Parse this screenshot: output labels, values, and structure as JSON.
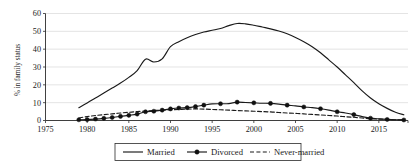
{
  "chart_data": {
    "type": "line",
    "title": "",
    "xlabel": "",
    "ylabel": "% in family status",
    "xlim": [
      1975,
      2018.5
    ],
    "ylim": [
      0,
      60
    ],
    "yticks": [
      0,
      10,
      20,
      30,
      40,
      50,
      60
    ],
    "xticks": [
      1975,
      1980,
      1985,
      1990,
      1995,
      2000,
      2005,
      2010,
      2015
    ],
    "ytick_labels": [
      "0",
      "10",
      "20",
      "30",
      "40",
      "50",
      "60"
    ],
    "xtick_labels": [
      "1975",
      "1980",
      "1985",
      "1990",
      "1995",
      "2000",
      "2005",
      "2010",
      "2015"
    ],
    "grid": "horizontal",
    "legend_position": "bottom",
    "x": [
      1979,
      1980,
      1981,
      1982,
      1983,
      1984,
      1985,
      1986,
      1987,
      1988,
      1989,
      1990,
      1991,
      1992,
      1993,
      1994,
      1995,
      1996,
      1997,
      1998,
      1999,
      2000,
      2001,
      2002,
      2003,
      2004,
      2005,
      2006,
      2007,
      2008,
      2009,
      2010,
      2011,
      2012,
      2013,
      2014,
      2015,
      2016,
      2017,
      2018
    ],
    "series": [
      {
        "name": "Married",
        "style": "solid",
        "markers": false,
        "values": [
          7.2,
          9.8,
          12.6,
          15.4,
          18.2,
          21.0,
          24.2,
          28.0,
          34.4,
          32.8,
          34.6,
          41.4,
          44.2,
          46.4,
          48.2,
          49.6,
          50.6,
          51.6,
          53.2,
          54.4,
          54.2,
          53.4,
          52.4,
          51.4,
          50.2,
          48.6,
          46.6,
          44.2,
          41.4,
          38.0,
          34.0,
          30.0,
          25.6,
          21.2,
          16.6,
          12.6,
          9.4,
          6.8,
          4.6,
          3.2
        ]
      },
      {
        "name": "Divorced",
        "style": "solid",
        "markers": true,
        "values": [
          0.4,
          0.5,
          0.8,
          1.2,
          1.7,
          2.3,
          2.9,
          3.6,
          4.9,
          5.2,
          5.8,
          6.5,
          7.0,
          7.2,
          7.8,
          8.6,
          9.3,
          9.4,
          9.5,
          10.3,
          10.1,
          9.9,
          9.7,
          9.6,
          9.2,
          8.6,
          8.2,
          7.6,
          7.2,
          6.6,
          5.8,
          4.9,
          4.2,
          3.3,
          2.2,
          1.3,
          0.9,
          0.6,
          0.4,
          0.3
        ]
      },
      {
        "name": "Never-married",
        "style": "dashed",
        "markers": false,
        "values": [
          1.4,
          2.2,
          2.8,
          3.3,
          3.7,
          4.2,
          4.6,
          5.0,
          5.3,
          5.6,
          5.8,
          6.0,
          6.2,
          6.4,
          6.5,
          6.4,
          6.2,
          6.0,
          5.8,
          5.6,
          5.4,
          5.2,
          5.0,
          4.8,
          4.5,
          4.2,
          4.0,
          3.7,
          3.4,
          3.1,
          2.8,
          2.5,
          2.1,
          1.8,
          1.4,
          1.0,
          0.8,
          0.6,
          0.4,
          0.3
        ]
      }
    ],
    "marker_years": [
      1979,
      1980,
      1981,
      1982,
      1983,
      1984,
      1985,
      1986,
      1987,
      1988,
      1989,
      1990,
      1991,
      1992,
      1993,
      1994,
      1996,
      1998,
      2000,
      2002,
      2004,
      2006,
      2008,
      2010,
      2012,
      2014,
      2016,
      2018
    ]
  },
  "legend": {
    "items": [
      {
        "label": "Married",
        "style": "solid",
        "marker": false
      },
      {
        "label": "Divorced",
        "style": "solid",
        "marker": true
      },
      {
        "label": "Never-married",
        "style": "dashed",
        "marker": false
      }
    ]
  },
  "colors": {
    "line": "#1a1a1a",
    "grid": "#d9d9d9",
    "axis": "#2b2b2b",
    "background": "#ffffff"
  }
}
